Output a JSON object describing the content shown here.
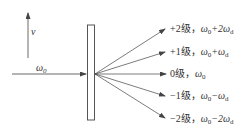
{
  "diagram": {
    "velocity_label": "v",
    "incident_label": {
      "base": "ω",
      "sub": "0"
    },
    "colors": {
      "line": "#444444",
      "text": "#333333",
      "background": "#ffffff"
    },
    "orders": [
      {
        "order": "+2级，",
        "freq_main": "ω",
        "freq_sub": "0",
        "freq_rest": "+2ω",
        "freq_rest_sub": "d"
      },
      {
        "order": "+1级，",
        "freq_main": "ω",
        "freq_sub": "0",
        "freq_rest": "+ω",
        "freq_rest_sub": "d"
      },
      {
        "order": "0级，",
        "freq_main": "ω",
        "freq_sub": "0",
        "freq_rest": "",
        "freq_rest_sub": ""
      },
      {
        "order": "−1级，",
        "freq_main": "ω",
        "freq_sub": "0",
        "freq_rest": "−ω",
        "freq_rest_sub": "d"
      },
      {
        "order": "−2级，",
        "freq_main": "ω",
        "freq_sub": "0",
        "freq_rest": "−2ω",
        "freq_rest_sub": "d"
      }
    ]
  }
}
